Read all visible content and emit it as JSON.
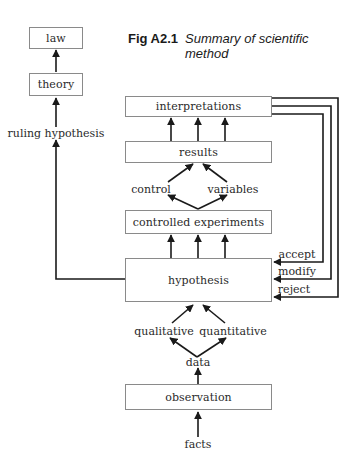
{
  "figure": {
    "number": "Fig A2.1",
    "title": "Summary of scientific method"
  },
  "nodes": {
    "law": "law",
    "theory": "theory",
    "ruling_hypothesis": "ruling hypothesis",
    "interpretations": "interpretations",
    "results": "results",
    "control": "control",
    "variables": "variables",
    "controlled_experiments": "controlled experiments",
    "hypothesis": "hypothesis",
    "qualitative": "qualitative",
    "quantitative": "quantitative",
    "data": "data",
    "observation": "observation",
    "facts": "facts"
  },
  "feedback_labels": {
    "accept": "accept",
    "modify": "modify",
    "reject": "reject"
  },
  "edges": [
    {
      "from": "facts",
      "to": "observation"
    },
    {
      "from": "observation",
      "to": "data"
    },
    {
      "from": "data",
      "to": "qualitative"
    },
    {
      "from": "data",
      "to": "quantitative"
    },
    {
      "from": "qualitative",
      "to": "hypothesis"
    },
    {
      "from": "quantitative",
      "to": "hypothesis"
    },
    {
      "from": "hypothesis",
      "to": "controlled experiments",
      "count": 3
    },
    {
      "from": "controlled experiments",
      "to": "control"
    },
    {
      "from": "controlled experiments",
      "to": "variables"
    },
    {
      "from": "control",
      "to": "results"
    },
    {
      "from": "variables",
      "to": "results"
    },
    {
      "from": "results",
      "to": "interpretations",
      "count": 3
    },
    {
      "from": "interpretations",
      "to": "hypothesis",
      "label": "accept"
    },
    {
      "from": "interpretations",
      "to": "hypothesis",
      "label": "modify"
    },
    {
      "from": "interpretations",
      "to": "hypothesis",
      "label": "reject"
    },
    {
      "from": "hypothesis",
      "to": "ruling hypothesis"
    },
    {
      "from": "ruling hypothesis",
      "to": "theory"
    },
    {
      "from": "theory",
      "to": "law"
    }
  ],
  "colors": {
    "line": "#1a1a1a",
    "box_border": "#8a8a8a",
    "text": "#2a2a2a"
  }
}
